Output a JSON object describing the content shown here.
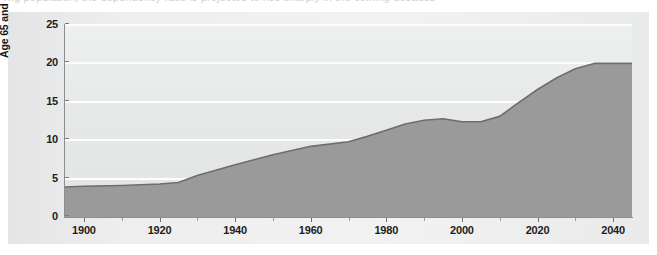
{
  "figure": {
    "top_cut_text": "ng population, the dependency ratio is projected to rise sharply in the coming decades"
  },
  "chart_data": {
    "type": "area",
    "title": "",
    "subtitle": "",
    "xlabel": "",
    "ylabel": "Age 65 and over (percentage)",
    "xlim": [
      1895,
      2045
    ],
    "ylim": [
      0,
      25
    ],
    "grid": true,
    "legend": "none",
    "colors": {
      "area_fill": "#9a9a9a",
      "line": "#6d6d6d",
      "plot_background": "#e7e8e8",
      "gridline": "#fdfdfd",
      "panel_background": "#eceded",
      "axis": "#8d8d8d",
      "text": "#1d1d1d"
    },
    "y_ticks": [
      0,
      5,
      10,
      15,
      20,
      25
    ],
    "y_tick_labels": [
      "0",
      "5",
      "10",
      "15",
      "20",
      "25"
    ],
    "x_ticks": [
      1900,
      1920,
      1940,
      1960,
      1980,
      2000,
      2020,
      2040
    ],
    "x_tick_labels": [
      "1900",
      "1920",
      "1940",
      "1960",
      "1980",
      "2000",
      "2020",
      "2040"
    ],
    "x_minor_ticks": [
      1910,
      1930,
      1950,
      1970,
      1990,
      2010,
      2030
    ],
    "x": [
      1895,
      1900,
      1910,
      1920,
      1925,
      1930,
      1940,
      1950,
      1960,
      1970,
      1975,
      1980,
      1985,
      1990,
      1995,
      2000,
      2005,
      2010,
      2015,
      2020,
      2025,
      2030,
      2035,
      2040,
      2045
    ],
    "values": [
      3.9,
      4.0,
      4.1,
      4.3,
      4.5,
      5.4,
      6.8,
      8.1,
      9.2,
      9.8,
      10.5,
      11.3,
      12.1,
      12.6,
      12.8,
      12.4,
      12.4,
      13.1,
      14.9,
      16.6,
      18.1,
      19.3,
      20.0,
      20.0,
      20.0
    ],
    "series_name": "Age 65 and over",
    "annotations": []
  }
}
